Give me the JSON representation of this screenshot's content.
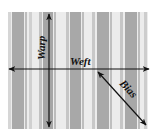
{
  "diagram": {
    "background": "#ffffff",
    "fabric": {
      "x": 8,
      "y": 12,
      "width": 140,
      "height": 117,
      "base_color": "#ececec",
      "stripes": [
        {
          "x": 8,
          "w": 3,
          "color": "#d6d6d6"
        },
        {
          "x": 12,
          "w": 12,
          "color": "#a9a9a9"
        },
        {
          "x": 25,
          "w": 2,
          "color": "#bdbdbd"
        },
        {
          "x": 29,
          "w": 3,
          "color": "#d0d0d0"
        },
        {
          "x": 39,
          "w": 3,
          "color": "#c2c2c2"
        },
        {
          "x": 43,
          "w": 10,
          "color": "#a6a6a6"
        },
        {
          "x": 54,
          "w": 2,
          "color": "#bcbcbc"
        },
        {
          "x": 66,
          "w": 3,
          "color": "#c6c6c6"
        },
        {
          "x": 70,
          "w": 11,
          "color": "#a8a8a8"
        },
        {
          "x": 82,
          "w": 2,
          "color": "#bebebe"
        },
        {
          "x": 92,
          "w": 3,
          "color": "#c8c8c8"
        },
        {
          "x": 97,
          "w": 12,
          "color": "#a9a9a9"
        },
        {
          "x": 110,
          "w": 2,
          "color": "#bfbfbf"
        },
        {
          "x": 120,
          "w": 3,
          "color": "#c6c6c6"
        },
        {
          "x": 125,
          "w": 12,
          "color": "#a8a8a8"
        },
        {
          "x": 138,
          "w": 2,
          "color": "#bdbdbd"
        },
        {
          "x": 144,
          "w": 3,
          "color": "#cdcdcd"
        }
      ]
    },
    "arrows": {
      "warp": {
        "label": "Warp",
        "x1": 49,
        "y1": 14,
        "x2": 49,
        "y2": 127,
        "color": "#111111"
      },
      "weft": {
        "label": "Weft",
        "x1": 9,
        "y1": 69,
        "x2": 149,
        "y2": 69,
        "color": "#111111"
      },
      "bias": {
        "label": "Bias",
        "x1": 98,
        "y1": 72,
        "x2": 146,
        "y2": 125,
        "color": "#111111"
      }
    }
  }
}
